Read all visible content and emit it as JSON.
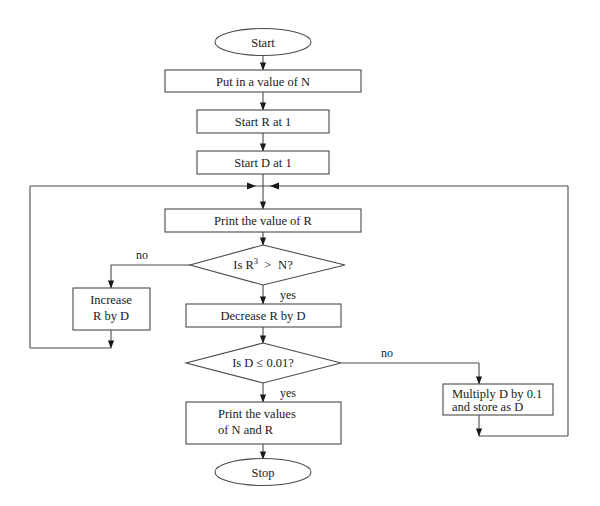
{
  "diagram": {
    "background_color": "#ffffff",
    "line_color": "#4a4a4a",
    "text_color": "#1a1a1a"
  },
  "nodes": {
    "start": {
      "label": "Start",
      "shape": "terminator"
    },
    "input_n": {
      "label": "Put in a value of N",
      "shape": "process"
    },
    "start_r": {
      "label": "Start R at 1",
      "shape": "process"
    },
    "start_d": {
      "label": "Start D at 1",
      "shape": "process"
    },
    "print_r": {
      "label": "Print the value of R",
      "shape": "process"
    },
    "test_cube": {
      "shape": "decision",
      "prefix": "Is R",
      "exponent": "3",
      "operator": ">",
      "operand": "N?",
      "label": "Is R3 > N?"
    },
    "increase_r": {
      "shape": "process",
      "line1": "Increase",
      "line2": "R by D",
      "label": "Increase R by D"
    },
    "decrease_r": {
      "label": "Decrease R by D",
      "shape": "process"
    },
    "test_d": {
      "label": "Is D ≤ 0.01?",
      "shape": "decision"
    },
    "multiply_d": {
      "shape": "process",
      "line1": "Multiply D by 0.1",
      "line2": "and store as D",
      "label": "Multiply D by 0.1 and store as D"
    },
    "print_values": {
      "shape": "process",
      "line1": "Print the values",
      "line2": "of N and R",
      "label": "Print the values of N and R"
    },
    "stop": {
      "label": "Stop",
      "shape": "terminator"
    }
  },
  "branch_labels": {
    "cube_no": "no",
    "cube_yes": "yes",
    "d_no": "no",
    "d_yes": "yes"
  }
}
